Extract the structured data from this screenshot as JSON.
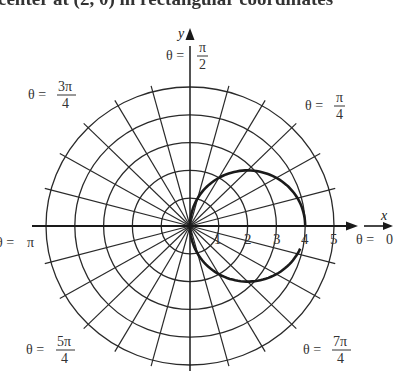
{
  "caption": "center at (2, 0) in rectangular coordinates",
  "axes": {
    "x_label": "x",
    "y_label": "y"
  },
  "radial_ticks": [
    "1",
    "2",
    "3",
    "4",
    "5"
  ],
  "angle_labels": {
    "theta_0": {
      "prefix": "θ = ",
      "num": "0",
      "den": ""
    },
    "theta_pi_4": {
      "prefix": "θ = ",
      "num": "π",
      "den": "4"
    },
    "theta_pi_2": {
      "prefix": "θ = ",
      "num": "π",
      "den": "2"
    },
    "theta_3pi_4": {
      "prefix": "θ = ",
      "num": "3π",
      "den": "4"
    },
    "theta_pi": {
      "prefix": "θ = ",
      "num": "π",
      "den": ""
    },
    "theta_5pi_4": {
      "prefix": "θ = ",
      "num": "5π",
      "den": "4"
    },
    "theta_7pi_4": {
      "prefix": "θ = ",
      "num": "7π",
      "den": "4"
    }
  },
  "grid": {
    "rings": 5,
    "ray_step_degrees": 15,
    "center_px": [
      190,
      226
    ],
    "unit_px": [
      28.8,
      27.8
    ]
  },
  "curve": {
    "description": "circle r = 4 cos θ, radius 2, center (2,0)",
    "center": [
      2,
      0
    ],
    "radius": 2
  },
  "colors": {
    "ink": "#1a1a1a",
    "background": "#ffffff"
  }
}
